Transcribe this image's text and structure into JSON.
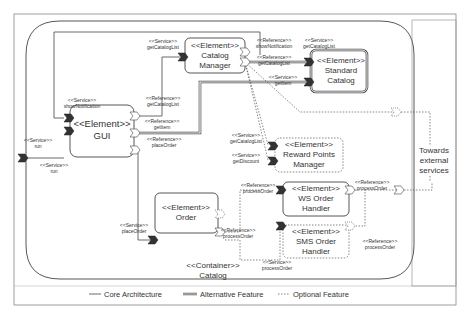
{
  "diagram": {
    "container": {
      "stereotype": "<<Container>>",
      "name": "Catalog"
    },
    "external": {
      "text_line1": "Towards",
      "text_line2": "external",
      "text_line3": "services"
    },
    "elements": {
      "catalog_manager": {
        "stereotype": "<<Element>>",
        "line1": "Catalog",
        "line2": "Manager"
      },
      "standard_catalog": {
        "stereotype": "<<Element>>",
        "line1": "Standard",
        "line2": "Catalog"
      },
      "gui": {
        "stereotype": "<<Element>>",
        "line1": "GUI"
      },
      "reward_points_manager": {
        "stereotype": "<<Element>>",
        "line1": "Reward Points",
        "line2": "Manager"
      },
      "ws_order_handler": {
        "stereotype": "<<Element>>",
        "line1": "WS Order",
        "line2": "Handler"
      },
      "order": {
        "stereotype": "<<Element>>",
        "line1": "Order"
      },
      "sms_order_handler": {
        "stereotype": "<<Element>>",
        "line1": "SMS Order",
        "line2": "Handler"
      }
    },
    "ports": {
      "cm_service": {
        "kind": "<<Service>>",
        "name": "getCatalogList"
      },
      "cm_ref_notify": {
        "kind": "<<Reference>>",
        "name": "showNotification"
      },
      "cm_ref_catalog": {
        "kind": "<<Reference>>",
        "name": "getCatalogList"
      },
      "sc_service_catalog": {
        "kind": "<<Service>>",
        "name": "getCatalogList"
      },
      "sc_service_item": {
        "kind": "<<Service>>",
        "name": "getItem"
      },
      "gui_service_notify": {
        "kind": "<<Service>>",
        "name": "showNotification"
      },
      "gui_service_run": {
        "kind": "<<Service>>",
        "name": "run"
      },
      "outer_service_run": {
        "kind": "<<Service>>",
        "name": "run"
      },
      "gui_ref_catalog": {
        "kind": "<<Reference>>",
        "name": "getCatalogList"
      },
      "gui_ref_item": {
        "kind": "<<Reference>>",
        "name": "getItem"
      },
      "gui_ref_order": {
        "kind": "<<Reference>>",
        "name": "placeOrder"
      },
      "rpm_service_catalog": {
        "kind": "<<Service>>",
        "name": "getCatalogList"
      },
      "rpm_service_discount": {
        "kind": "<<Service>>",
        "name": "getDiscount"
      },
      "ws_ref_in": {
        "kind": "<<Reference>>",
        "name": "processOrder"
      },
      "ws_ref_out": {
        "kind": "<<Reference>>",
        "name": "processOrder"
      },
      "order_service": {
        "kind": "<<Service>>",
        "name": "placeOrder"
      },
      "order_ref": {
        "kind": "<<Reference>>",
        "name": "processOrder"
      },
      "sms_service": {
        "kind": "<<Service>>",
        "name": "processOrder"
      },
      "sms_ref": {
        "kind": "<<Reference>>",
        "name": "processOrder"
      }
    }
  },
  "legend": {
    "core": "Core Architecture",
    "alternative": "Alternative Feature",
    "optional": "Optional Feature"
  },
  "colors": {
    "line": "#444444",
    "port_fill": "#333333",
    "frame": "#777777"
  }
}
